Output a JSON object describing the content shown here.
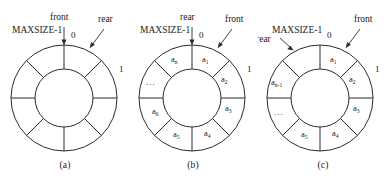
{
  "figure": {
    "background": "#ffffff",
    "stroke_color": "#2b2b2b"
  },
  "panels": [
    {
      "id": "a",
      "caption": "(a)",
      "maxsize_label": "MAXSIZE-1",
      "index_zero": "0",
      "index_one": "1",
      "pointers": [
        {
          "name": "front",
          "label": "front"
        },
        {
          "name": "rear",
          "label": "rear"
        }
      ],
      "sectors": [
        "",
        "",
        "",
        "",
        "",
        "",
        "",
        ""
      ],
      "sector_subs": [
        "",
        "",
        "",
        "",
        "",
        "",
        "",
        ""
      ],
      "ellipsis": ""
    },
    {
      "id": "b",
      "caption": "(b)",
      "maxsize_label": "MAXSIZE-1",
      "index_zero": "0",
      "index_one": "1",
      "pointers": [
        {
          "name": "rear",
          "label": "rear"
        },
        {
          "name": "front",
          "label": "front"
        }
      ],
      "sectors": [
        "a",
        "a",
        "a",
        "a",
        "a",
        "a",
        "",
        "a"
      ],
      "sector_subs": [
        "1",
        "2",
        "3",
        "4",
        "5",
        "6",
        "",
        "n"
      ],
      "ellipsis": "..."
    },
    {
      "id": "c",
      "caption": "(c)",
      "maxsize_label": "MAXSIZE-1",
      "index_zero": "0",
      "index_one": "1",
      "pointers": [
        {
          "name": "rear",
          "label": "rear"
        },
        {
          "name": "front",
          "label": "front"
        }
      ],
      "sectors": [
        "a",
        "a",
        "a",
        "a",
        "a",
        "",
        "a",
        ""
      ],
      "sector_subs": [
        "1",
        "2",
        "3",
        "4",
        "5",
        "",
        "n-1",
        ""
      ],
      "ellipsis": "..."
    }
  ]
}
